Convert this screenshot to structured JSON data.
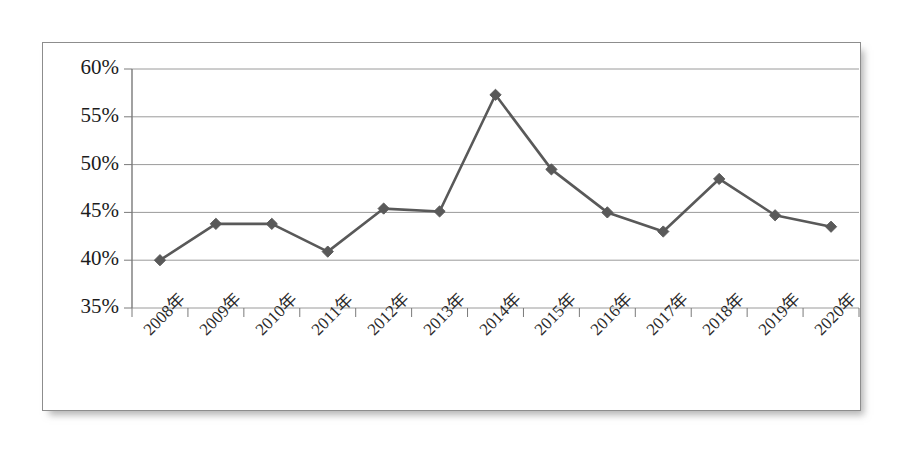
{
  "chart_data": {
    "type": "line",
    "title": "",
    "subtitle": "",
    "xlabel": "",
    "ylabel": "",
    "categories": [
      "2008年",
      "2009年",
      "2010年",
      "2011年",
      "2012年",
      "2013年",
      "2014年",
      "2015年",
      "2016年",
      "2017年",
      "2018年",
      "2019年",
      "2020年"
    ],
    "values": [
      40.0,
      43.8,
      43.8,
      40.9,
      45.4,
      45.1,
      57.3,
      49.5,
      45.0,
      43.0,
      48.5,
      44.7,
      43.5
    ],
    "series": [
      {
        "name": "",
        "values": [
          40.0,
          43.8,
          43.8,
          40.9,
          45.4,
          45.1,
          57.3,
          49.5,
          45.0,
          43.0,
          48.5,
          44.7,
          43.5
        ]
      }
    ],
    "ylim": [
      35,
      60
    ],
    "ytick_values": [
      60,
      55,
      50,
      45,
      40,
      35
    ],
    "ytick_labels": [
      "60%",
      "55%",
      "50%",
      "45%",
      "40%",
      "35%"
    ],
    "ytick_suffix": "%",
    "grid": true,
    "grid_axis": "y",
    "legend": false,
    "legend_position": "none",
    "marker": "diamond",
    "line_color": "#595959",
    "marker_color": "#595959",
    "grid_color": "#9a9a9a",
    "axis_color": "#7a7a7a",
    "background_color": "#ffffff",
    "frame_border_color": "#8d8d8d"
  }
}
